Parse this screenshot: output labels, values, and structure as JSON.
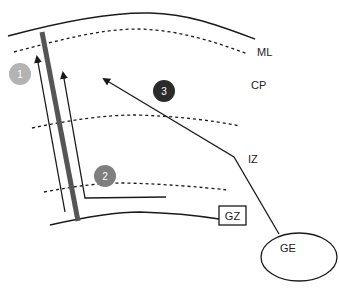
{
  "labels": {
    "ml": "ML",
    "cp": "CP",
    "iz": "IZ",
    "gz": "GZ",
    "ge": "GE"
  },
  "markers": [
    {
      "number": "1",
      "color": "#b3b3b3"
    },
    {
      "number": "2",
      "color": "#7f7f7f"
    },
    {
      "number": "3",
      "color": "#2b2b2b"
    }
  ],
  "colors": {
    "line": "#1a1a1a",
    "radial_glia_bar": "#555555",
    "background": "#ffffff"
  }
}
